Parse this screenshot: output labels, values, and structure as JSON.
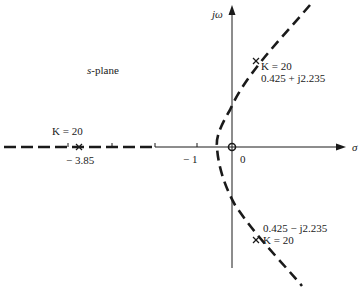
{
  "diagram": {
    "plane_label_var": "s",
    "plane_label_rest": "-plane",
    "axes": {
      "imag_axis_label": "jω",
      "real_axis_label": "σ"
    },
    "ticks": {
      "origin": "0",
      "minus_one": "− 1",
      "breakaway": "− 3.85"
    },
    "annotations": {
      "real_pole": {
        "gain": "K = 20"
      },
      "upper_pole": {
        "gain": "K = 20",
        "value": "0.425 + j2.235"
      },
      "lower_pole": {
        "gain": "K = 20",
        "value": "0.425 − j2.235"
      }
    },
    "markers": {
      "pole_marker": "x",
      "zero_marker": "o"
    },
    "colors": {
      "line": "#1a1a1a",
      "background": "#ffffff"
    }
  }
}
